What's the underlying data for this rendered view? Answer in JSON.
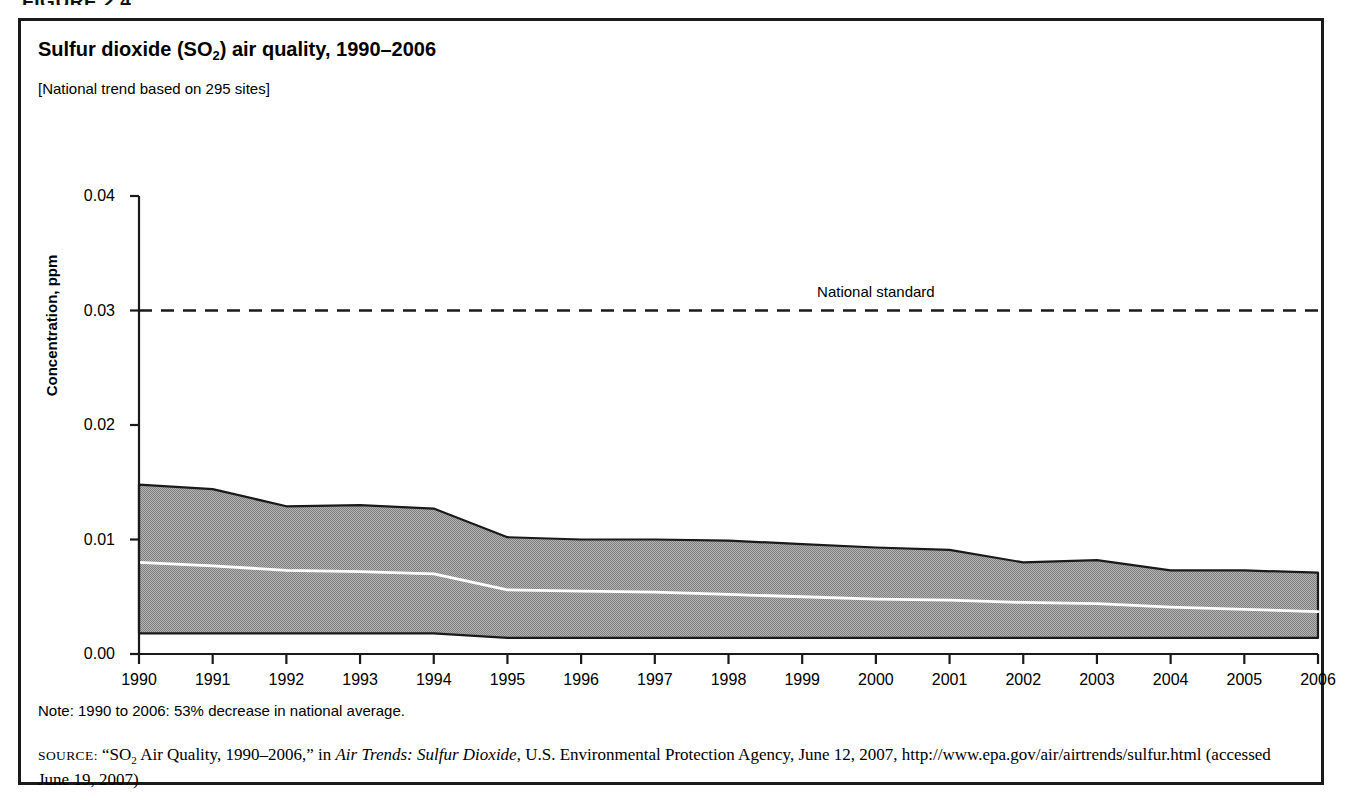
{
  "figure_head": "FIGURE 2.4",
  "chart_title_pre": "Sulfur dioxide (SO",
  "chart_title_sub": "2",
  "chart_title_post": ") air quality, 1990–2006",
  "chart_subtitle": "[National trend based on 295 sites]",
  "note": "Note: 1990 to 2006: 53% decrease in national average.",
  "source": {
    "label": "SOURCE:",
    "text_1": "“SO",
    "sub_1": "2",
    "text_2": " Air Quality, 1990–2006,” in ",
    "italic_1": "Air Trends: Sulfur Dioxide",
    "text_3": ", U.S. Environmental Protection Agency, June 12, 2007, http://www.epa.gov/air/airtrends/sulfur.html (accessed June 19, 2007)"
  },
  "colors": {
    "band_fill": "#9d9d9d",
    "band_edge": "#1a1a1a",
    "mean_line": "#ffffff",
    "standard_line": "#1a1a1a",
    "axis": "#1a1a1a",
    "border": "#1a1a1a",
    "background": "#ffffff"
  },
  "chart_data": {
    "type": "area",
    "title": "Sulfur dioxide (SO2) air quality, 1990–2006",
    "subtitle": "[National trend based on 295 sites]",
    "xlabel": "",
    "ylabel": "Concentration, ppm",
    "xlim": [
      1990,
      2006
    ],
    "ylim": [
      0.0,
      0.04
    ],
    "yticks": [
      0.0,
      0.01,
      0.02,
      0.03,
      0.04
    ],
    "ytick_labels": [
      "0.00",
      "0.01",
      "0.02",
      "0.03",
      "0.04"
    ],
    "xticks": [
      1990,
      1991,
      1992,
      1993,
      1994,
      1995,
      1996,
      1997,
      1998,
      1999,
      2000,
      2001,
      2002,
      2003,
      2004,
      2005,
      2006
    ],
    "xtick_labels": [
      "1990",
      "1991",
      "1992",
      "1993",
      "1994",
      "1995",
      "1996",
      "1997",
      "1998",
      "1999",
      "2000",
      "2001",
      "2002",
      "2003",
      "2004",
      "2005",
      "2006"
    ],
    "grid": false,
    "legend": false,
    "x": [
      1990,
      1991,
      1992,
      1993,
      1994,
      1995,
      1996,
      1997,
      1998,
      1999,
      2000,
      2001,
      2002,
      2003,
      2004,
      2005,
      2006
    ],
    "series": [
      {
        "name": "90th percentile",
        "role": "band_upper",
        "values": [
          0.0148,
          0.0144,
          0.0129,
          0.013,
          0.0127,
          0.0102,
          0.01,
          0.01,
          0.0099,
          0.0096,
          0.0093,
          0.0091,
          0.008,
          0.0082,
          0.0073,
          0.0073,
          0.0071
        ]
      },
      {
        "name": "Mean",
        "role": "mean_line",
        "values": [
          0.008,
          0.0077,
          0.0073,
          0.0072,
          0.007,
          0.0056,
          0.0055,
          0.0054,
          0.0052,
          0.005,
          0.0048,
          0.0047,
          0.0045,
          0.0044,
          0.0041,
          0.0039,
          0.0037
        ]
      },
      {
        "name": "10th percentile",
        "role": "band_lower",
        "values": [
          0.0018,
          0.0018,
          0.0018,
          0.0018,
          0.0018,
          0.0014,
          0.0014,
          0.0014,
          0.0014,
          0.0014,
          0.0014,
          0.0014,
          0.0014,
          0.0014,
          0.0014,
          0.0014,
          0.0014
        ]
      }
    ],
    "annotations": [
      {
        "name": "national-standard",
        "label": "National standard",
        "value": 0.03,
        "x": 2000.0,
        "style": "dashed-horizontal-line"
      }
    ]
  }
}
